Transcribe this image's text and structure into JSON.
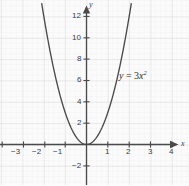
{
  "chart_data": {
    "type": "line",
    "title": "",
    "xlabel": "x",
    "ylabel": "y",
    "equation_label": "y = 3x²",
    "equation_parts": {
      "lhs": "y",
      "eq": "=",
      "coef": "3",
      "base": "x",
      "exp": "2"
    },
    "function": "y = 3x^2",
    "coefficient": 3,
    "grid": true,
    "grid_minor": true,
    "legend": "none",
    "xlim": [
      -3.9,
      4.7
    ],
    "ylim": [
      -3.6,
      13.2
    ],
    "x_ticks": [
      -3,
      -2,
      -1,
      1,
      2,
      3,
      4
    ],
    "x_tick_labels": [
      "−3",
      "−2",
      "−1",
      "1",
      "2",
      "3",
      "4"
    ],
    "y_ticks": [
      -2,
      2,
      4,
      6,
      8,
      10,
      12
    ],
    "y_tick_labels": [
      "−2",
      "2",
      "4",
      "6",
      "8",
      "10",
      "12"
    ],
    "points": [
      {
        "x": -2.1,
        "y": 13.23
      },
      {
        "x": -2.0,
        "y": 12
      },
      {
        "x": -1.5,
        "y": 6.75
      },
      {
        "x": -1.0,
        "y": 3
      },
      {
        "x": -0.5,
        "y": 0.75
      },
      {
        "x": 0,
        "y": 0
      },
      {
        "x": 0.5,
        "y": 0.75
      },
      {
        "x": 1.0,
        "y": 3
      },
      {
        "x": 1.5,
        "y": 6.75
      },
      {
        "x": 2.0,
        "y": 12
      },
      {
        "x": 2.1,
        "y": 13.23
      }
    ],
    "colors": {
      "curve": "#4a4a4a",
      "axis": "#4a4a4a",
      "grid_major": "#d9d9d9",
      "grid_minor": "#ececec",
      "background": "#fbfbfb",
      "text": "#3b3b3b"
    }
  },
  "axes": {
    "x_axis_name": "x",
    "y_axis_name": "y"
  }
}
